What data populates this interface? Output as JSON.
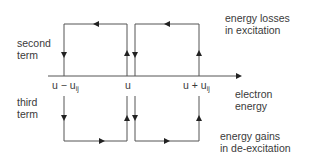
{
  "labels": {
    "second_term_line1": "second",
    "second_term_line2": "term",
    "third_term_line1": "third",
    "third_term_line2": "term",
    "losses_line1": "energy losses",
    "losses_line2": "in excitation",
    "gains_line1": "energy gains",
    "gains_line2": "in de-excitation",
    "axis_line1": "electron",
    "axis_line2": "energy"
  },
  "ticks": {
    "left_main": "u − u",
    "left_sub": "ij",
    "center": "u",
    "right_main": "u + u",
    "right_sub": "ij"
  },
  "colors": {
    "line": "#555555",
    "text": "#3a3a3a"
  }
}
